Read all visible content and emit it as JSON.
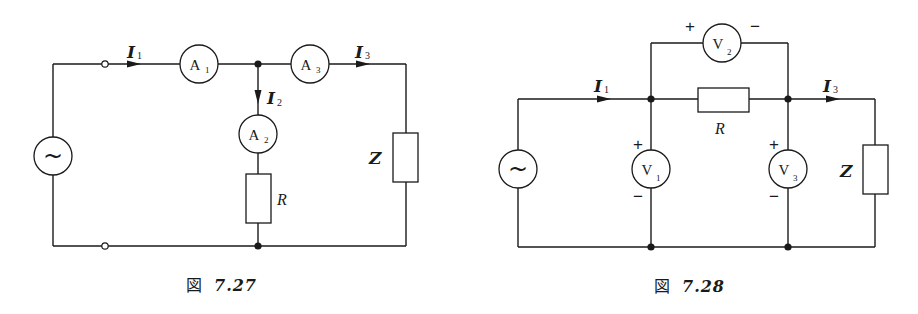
{
  "figures": [
    {
      "caption_prefix": "図",
      "caption_number": "7.27",
      "source_symbol": "~",
      "labels": {
        "I1": "I",
        "I1_sub": "1",
        "I2": "I",
        "I2_sub": "2",
        "I3": "I",
        "I3_sub": "3",
        "Z": "Z",
        "R": "R"
      },
      "meters": [
        {
          "letter": "A",
          "sub": "1"
        },
        {
          "letter": "A",
          "sub": "2"
        },
        {
          "letter": "A",
          "sub": "3"
        }
      ]
    },
    {
      "caption_prefix": "図",
      "caption_number": "7.28",
      "source_symbol": "~",
      "labels": {
        "I1": "I",
        "I1_sub": "1",
        "I3": "I",
        "I3_sub": "3",
        "Z": "Z",
        "R": "R",
        "plus": "+",
        "minus": "−"
      },
      "meters": [
        {
          "letter": "V",
          "sub": "1"
        },
        {
          "letter": "V",
          "sub": "2"
        },
        {
          "letter": "V",
          "sub": "3"
        }
      ]
    }
  ]
}
